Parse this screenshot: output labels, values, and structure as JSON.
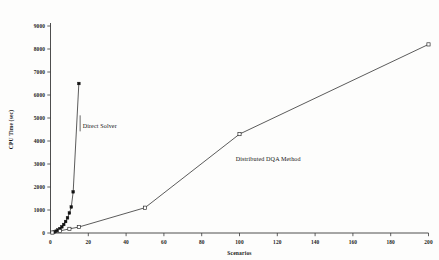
{
  "chart_data": {
    "type": "line",
    "title": "",
    "xlabel": "Scenarios",
    "ylabel": "CPU Time (sec)",
    "xlim": [
      0,
      200
    ],
    "ylim": [
      0,
      9000
    ],
    "xticks": [
      0,
      20,
      40,
      60,
      80,
      100,
      120,
      140,
      160,
      180,
      200
    ],
    "xtick_labels": [
      "0",
      "20",
      "40",
      "60",
      "80",
      "100",
      "120",
      "140",
      "160",
      "180",
      "200"
    ],
    "yticks": [
      0,
      1000,
      2000,
      3000,
      4000,
      5000,
      6000,
      7000,
      8000,
      9000
    ],
    "ytick_labels": [
      "0",
      "1000",
      "2000",
      "3000",
      "4000",
      "5000",
      "6000",
      "7000",
      "8000",
      "9000"
    ],
    "grid": false,
    "legend": "none",
    "annotations": [
      {
        "text": "Direct Solver",
        "x": 17,
        "y": 4550,
        "target_x": 13,
        "target_y": 5600
      },
      {
        "text": "Distributed DQA Method",
        "x": 98,
        "y": 3150,
        "target_x": 83,
        "target_y": 3450
      }
    ],
    "series": [
      {
        "name": "Direct Solver",
        "marker": "filled-square",
        "x": [
          1,
          2,
          3,
          4,
          5,
          6,
          7,
          8,
          9,
          10,
          11,
          12,
          15
        ],
        "y": [
          20,
          45,
          80,
          130,
          190,
          270,
          370,
          500,
          660,
          870,
          1130,
          1790,
          6500
        ]
      },
      {
        "name": "Distributed DQA Method",
        "marker": "open-square",
        "x": [
          1,
          5,
          10,
          15,
          50,
          100,
          200
        ],
        "y": [
          20,
          90,
          180,
          260,
          1100,
          4300,
          8200
        ]
      }
    ]
  },
  "axis_titles": {
    "x": "Scenarios",
    "y": "CPU Time (sec)"
  }
}
